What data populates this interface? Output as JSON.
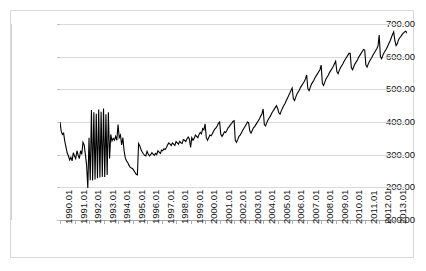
{
  "chart_data": {
    "type": "line",
    "title": "",
    "subtitle": "",
    "xlabel": "",
    "ylabel": "",
    "ylim": [
      100,
      700
    ],
    "ytick_labels": [
      "700.00",
      "600.00",
      "500.00",
      "400.00",
      "300.00",
      "200.00",
      "100.00"
    ],
    "ytick_values": [
      700,
      600,
      500,
      400,
      300,
      200,
      100
    ],
    "grid": true,
    "legend": "none",
    "line_color": "#000000",
    "grid_color": "#d9d9d9",
    "xtick_labels": [
      "1990.01",
      "1991.01",
      "1992.01",
      "1993.01",
      "1994.01",
      "1995.01",
      "1996.01",
      "1997.01",
      "1998.01",
      "1999.01",
      "2000.01",
      "2001.01",
      "2002.01",
      "2003.01",
      "2004.01",
      "2005.01",
      "2006.01",
      "2007.01",
      "2008.01",
      "2009.01",
      "2010.01",
      "2011.01",
      "2012.01",
      "2013.01"
    ],
    "x_start": "1990.01",
    "x_end": "2013.12",
    "x_frequency": "monthly",
    "series": [
      {
        "name": "series-1",
        "values": [
          400,
          372,
          362,
          366,
          340,
          322,
          305,
          296,
          284,
          292,
          281,
          306,
          296,
          288,
          312,
          298,
          288,
          312,
          301,
          338,
          330,
          300,
          268,
          198,
          352,
          222,
          437,
          221,
          430,
          224,
          425,
          228,
          438,
          230,
          431,
          232,
          441,
          232,
          424,
          238,
          430,
          288,
          362,
          342,
          350,
          344,
          356,
          344,
          392,
          352,
          360,
          330,
          352,
          312,
          290,
          281,
          276,
          268,
          262,
          259,
          258,
          252,
          246,
          240,
          238,
          334,
          327,
          316,
          308,
          302,
          298,
          296,
          310,
          302,
          296,
          300,
          306,
          302,
          298,
          304,
          300,
          312,
          308,
          304,
          314,
          312,
          318,
          316,
          322,
          330,
          336,
          332,
          328,
          336,
          332,
          328,
          340,
          336,
          332,
          341,
          336,
          334,
          346,
          344,
          340,
          348,
          354,
          348,
          322,
          352,
          344,
          350,
          360,
          356,
          352,
          362,
          368,
          364,
          380,
          376,
          394,
          352,
          344,
          352,
          360,
          358,
          364,
          372,
          378,
          382,
          388,
          396,
          400,
          362,
          356,
          362,
          370,
          368,
          374,
          382,
          386,
          392,
          396,
          402,
          404,
          344,
          338,
          346,
          356,
          360,
          366,
          374,
          380,
          386,
          392,
          400,
          398,
          372,
          366,
          374,
          382,
          386,
          392,
          398,
          404,
          410,
          418,
          424,
          440,
          392,
          388,
          398,
          406,
          412,
          418,
          426,
          432,
          438,
          444,
          450,
          442,
          428,
          424,
          434,
          442,
          450,
          456,
          464,
          472,
          480,
          488,
          496,
          504,
          472,
          466,
          476,
          486,
          492,
          498,
          506,
          512,
          518,
          524,
          532,
          544,
          502,
          496,
          506,
          516,
          522,
          528,
          536,
          542,
          548,
          554,
          560,
          574,
          518,
          512,
          522,
          532,
          538,
          544,
          552,
          558,
          564,
          570,
          578,
          586,
          554,
          548,
          558,
          566,
          572,
          578,
          586,
          592,
          598,
          604,
          610,
          610,
          566,
          560,
          570,
          578,
          584,
          590,
          598,
          604,
          610,
          616,
          622,
          620,
          574,
          568,
          578,
          586,
          592,
          598,
          606,
          612,
          618,
          624,
          632,
          666,
          600,
          594,
          604,
          612,
          618,
          624,
          632,
          640,
          648,
          658,
          668,
          676,
          648,
          634,
          640,
          652,
          658,
          662,
          668,
          672,
          676,
          678,
          672
        ]
      }
    ]
  }
}
